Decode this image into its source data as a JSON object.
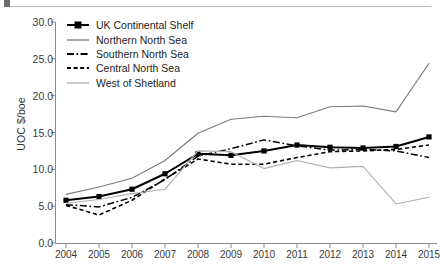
{
  "chart_data": {
    "type": "line",
    "title": "",
    "xlabel": "",
    "ylabel": "UOC $/boe",
    "x": [
      2004,
      2005,
      2006,
      2007,
      2008,
      2009,
      2010,
      2011,
      2012,
      2013,
      2014,
      2015
    ],
    "categories": [
      "2004",
      "2005",
      "2006",
      "2007",
      "2008",
      "2009",
      "2010",
      "2011",
      "2012",
      "2013",
      "2014",
      "2015"
    ],
    "xlim": [
      2004,
      2015
    ],
    "ylim": [
      0.0,
      30.0
    ],
    "yticks": [
      "0.0",
      "5.0",
      "10.0",
      "15.0",
      "20.0",
      "25.0",
      "30.0"
    ],
    "ytick_values": [
      0.0,
      5.0,
      10.0,
      15.0,
      20.0,
      25.0,
      30.0
    ],
    "grid": false,
    "legend_position": "upper left",
    "series": [
      {
        "name": "UK Continental Shelf",
        "values": [
          5.8,
          6.3,
          7.3,
          9.4,
          12.1,
          11.9,
          12.5,
          13.3,
          13.0,
          12.9,
          13.1,
          14.4
        ],
        "style": "solid-markers",
        "color": "#000000",
        "marker": "square",
        "width": 2.0
      },
      {
        "name": "Northern North Sea",
        "values": [
          6.6,
          7.6,
          8.8,
          11.2,
          14.9,
          16.8,
          17.2,
          17.0,
          18.5,
          18.6,
          17.8,
          24.4
        ],
        "style": "solid",
        "color": "#7a7a7a",
        "marker": "none",
        "width": 1.1
      },
      {
        "name": "Southern North Sea",
        "values": [
          5.2,
          4.9,
          6.2,
          8.6,
          11.8,
          12.8,
          14.0,
          13.2,
          12.6,
          12.7,
          12.5,
          11.6
        ],
        "style": "dash-dot",
        "color": "#000000",
        "marker": "none",
        "width": 1.5
      },
      {
        "name": "Central North Sea",
        "values": [
          5.1,
          3.8,
          5.8,
          8.7,
          11.4,
          10.7,
          10.7,
          11.6,
          12.4,
          12.5,
          12.7,
          13.3
        ],
        "style": "dashed",
        "color": "#000000",
        "marker": "none",
        "width": 1.6
      },
      {
        "name": "West of Shetland",
        "values": [
          5.4,
          5.9,
          6.7,
          7.3,
          12.5,
          12.4,
          10.1,
          11.2,
          10.2,
          10.4,
          5.3,
          6.2
        ],
        "style": "solid",
        "color": "#b0b0b0",
        "marker": "none",
        "width": 1.1
      }
    ]
  },
  "legend": {
    "items": [
      {
        "label": "UK Continental Shelf"
      },
      {
        "label": "Northern North Sea"
      },
      {
        "label": "Southern North Sea"
      },
      {
        "label": "Central North Sea"
      },
      {
        "label": "West of Shetland"
      }
    ]
  },
  "axes": {
    "y_label": "UOC $/boe",
    "y_ticks": [
      "30.0",
      "25.0",
      "20.0",
      "15.0",
      "10.0",
      "5.0",
      "0.0"
    ],
    "x_ticks": [
      "2004",
      "2005",
      "2006",
      "2007",
      "2008",
      "2009",
      "2010",
      "2011",
      "2012",
      "2013",
      "2014",
      "2015"
    ]
  },
  "colors": {
    "axis": "#8a8a8a",
    "text": "#333333",
    "ukcs": "#000000",
    "northern": "#7a7a7a",
    "southern": "#000000",
    "central": "#000000",
    "shetland": "#b0b0b0",
    "background": "#ffffff"
  }
}
